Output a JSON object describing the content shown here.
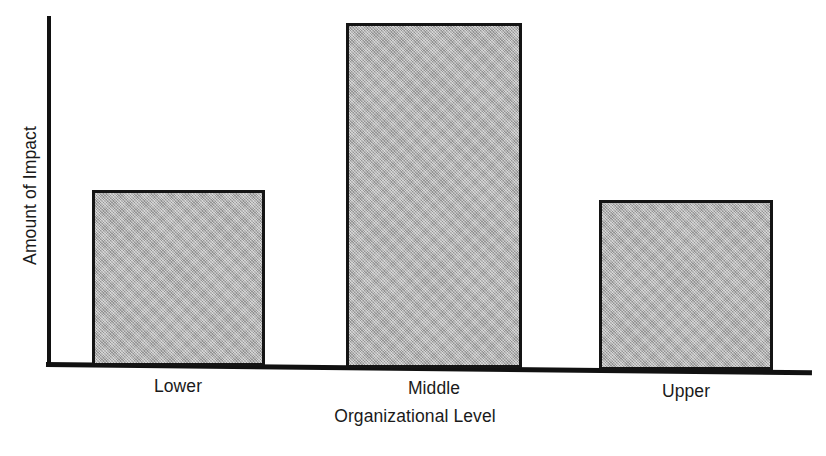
{
  "chart_data": {
    "type": "bar",
    "title": "",
    "subtitle": "",
    "xlabel": "Organizational Level",
    "ylabel": "Amount of Impact",
    "categories": [
      "Lower",
      "Middle",
      "Upper"
    ],
    "values": [
      176,
      345,
      170
    ],
    "value_units": "relative (unlabeled axis)",
    "ylim": [
      0,
      350
    ],
    "grid": false,
    "legend": null,
    "annotations": [],
    "axis_ticks": {
      "x": [
        "Lower",
        "Middle",
        "Upper"
      ],
      "y": []
    },
    "series": [
      {
        "name": "Amount of Impact",
        "values": [
          176,
          345,
          170
        ]
      }
    ],
    "style": {
      "bar_fill": "#b2b2b2",
      "bar_border": "#141414",
      "axis_color": "#111111",
      "background": "#ffffff",
      "text_color": "#1a1a1a"
    }
  },
  "bars": [
    {
      "label": "Lower",
      "value": 176
    },
    {
      "label": "Middle",
      "value": 345
    },
    {
      "label": "Upper",
      "value": 170
    }
  ]
}
